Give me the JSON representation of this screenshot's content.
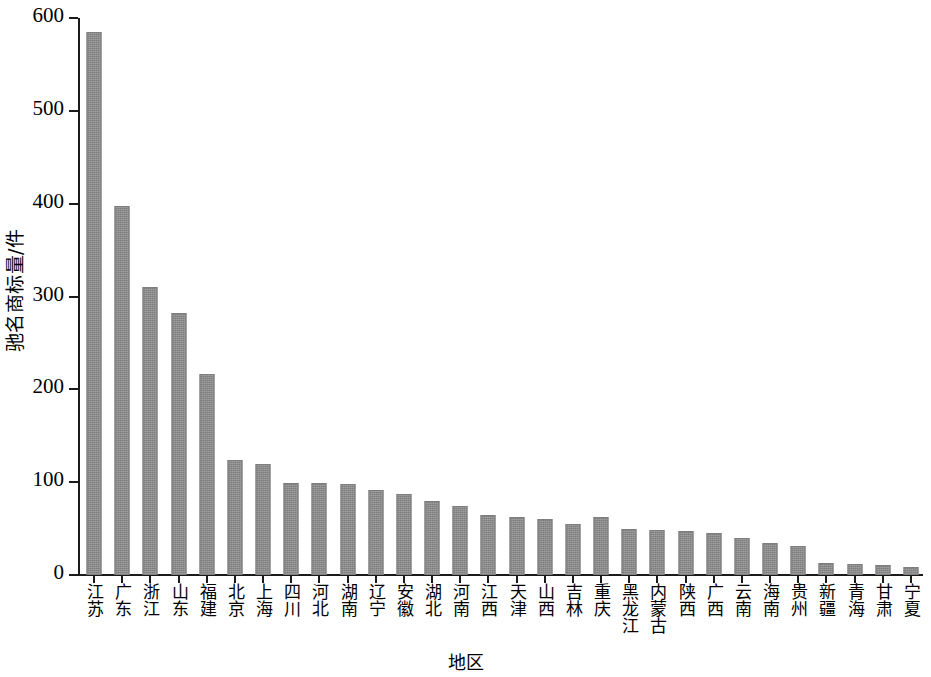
{
  "chart_data": {
    "type": "bar",
    "title": "",
    "xlabel": "地区",
    "ylabel": "驰名商标量/件",
    "ylim": [
      0,
      600
    ],
    "ytick_values": [
      0,
      100,
      200,
      300,
      400,
      500,
      600
    ],
    "ytick_labels": [
      "0",
      "100",
      "200",
      "300",
      "400",
      "500",
      "600"
    ],
    "grid": false,
    "legend": null,
    "bar_color": "#8d8d8d",
    "axis_color": "#1a1a1a",
    "categories": [
      "江苏",
      "广东",
      "浙江",
      "山东",
      "福建",
      "北京",
      "上海",
      "四川",
      "河北",
      "湖南",
      "辽宁",
      "安徽",
      "湖北",
      "河南",
      "江西",
      "天津",
      "山西",
      "吉林",
      "重庆",
      "黑龙江",
      "内蒙古",
      "陕西",
      "广西",
      "云南",
      "海南",
      "贵州",
      "新疆",
      "青海",
      "甘肃",
      "宁夏"
    ],
    "values": [
      585,
      397,
      310,
      282,
      217,
      124,
      120,
      99,
      99,
      98,
      92,
      87,
      80,
      74,
      65,
      63,
      60,
      55,
      62,
      50,
      48,
      47,
      45,
      40,
      35,
      31,
      13,
      12,
      11,
      9
    ]
  }
}
